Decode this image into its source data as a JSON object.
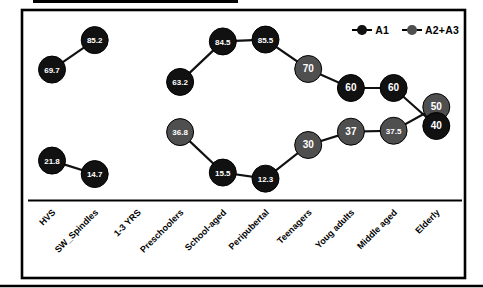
{
  "chart_data": {
    "type": "line",
    "title": "",
    "xlabel": "",
    "ylabel": "",
    "y_axis_visible": false,
    "x_axis_line": true,
    "grid": false,
    "legend_position": "top-right",
    "point_fill": {
      "black": "#111111",
      "gray": "#4f4f4f"
    },
    "line_color": "#111111",
    "categories": [
      "HVS",
      "SW_Spindles",
      "1-3 YRS",
      "Preschoolers",
      "School-aged",
      "Peripubertal",
      "Teenagers",
      "Youg adults",
      "Middle aged",
      "Elderly"
    ],
    "series": [
      {
        "name": "A1",
        "marker_color": "#111111",
        "points": [
          {
            "label": "69.7",
            "value": 69.7,
            "color": "black"
          },
          {
            "label": "85.2",
            "value": 85.2,
            "color": "black"
          },
          null,
          {
            "label": "63.2",
            "value": 63.2,
            "color": "black"
          },
          {
            "label": "84.5",
            "value": 84.5,
            "color": "black"
          },
          {
            "label": "85.5",
            "value": 85.5,
            "color": "black"
          },
          {
            "label": "70",
            "value": 70,
            "color": "gray"
          },
          {
            "label": "60",
            "value": 60,
            "color": "black"
          },
          {
            "label": "60",
            "value": 60,
            "color": "black"
          },
          {
            "label": "40",
            "value": 40,
            "color": "black"
          }
        ]
      },
      {
        "name": "A2+A3",
        "marker_color": "#4f4f4f",
        "points": [
          {
            "label": "21.8",
            "value": 21.8,
            "color": "black"
          },
          {
            "label": "14.7",
            "value": 14.7,
            "color": "black"
          },
          null,
          {
            "label": "36.8",
            "value": 36.8,
            "color": "gray"
          },
          {
            "label": "15.5",
            "value": 15.5,
            "color": "black"
          },
          {
            "label": "12.3",
            "value": 12.3,
            "color": "black"
          },
          {
            "label": "30",
            "value": 30,
            "color": "gray"
          },
          {
            "label": "37",
            "value": 37,
            "color": "gray"
          },
          {
            "label": "37.5",
            "value": 37.5,
            "color": "gray"
          },
          {
            "label": "50",
            "value": 50,
            "color": "gray"
          }
        ]
      }
    ]
  }
}
